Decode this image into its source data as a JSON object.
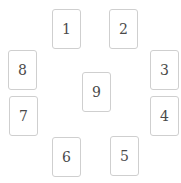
{
  "layout": {
    "card_width": 29,
    "card_height": 40,
    "border_color": "#cfcfcf",
    "text_color": "#4a4a4a",
    "background": "#ffffff"
  },
  "cards": [
    {
      "label": "1",
      "x": 52,
      "y": 9
    },
    {
      "label": "2",
      "x": 109,
      "y": 9
    },
    {
      "label": "3",
      "x": 150,
      "y": 50
    },
    {
      "label": "4",
      "x": 150,
      "y": 96
    },
    {
      "label": "5",
      "x": 110,
      "y": 136
    },
    {
      "label": "6",
      "x": 52,
      "y": 137
    },
    {
      "label": "7",
      "x": 9,
      "y": 96
    },
    {
      "label": "8",
      "x": 8,
      "y": 50
    },
    {
      "label": "9",
      "x": 82,
      "y": 72
    }
  ]
}
